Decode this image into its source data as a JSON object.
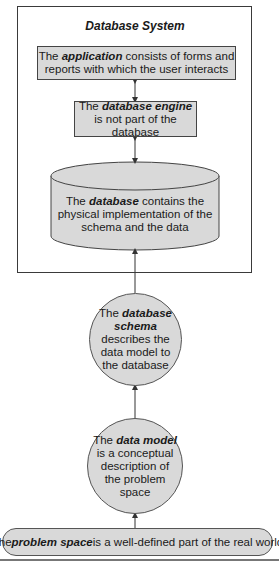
{
  "diagram": {
    "system_title": "Database System",
    "colors": {
      "node_fill": "#d9d9d9",
      "stroke": "#444444",
      "background": "#ffffff"
    },
    "nodes": {
      "application": {
        "prefix": "The ",
        "keyword": "application",
        "suffix": " consists of forms and reports with which the user interacts",
        "shape": "rectangle"
      },
      "engine": {
        "prefix": "The ",
        "keyword": "database engine",
        "suffix": " is not part of the database",
        "shape": "rectangle"
      },
      "database": {
        "prefix": "The ",
        "keyword": "database",
        "suffix": " contains the physical implementation of the schema and the data",
        "shape": "cylinder"
      },
      "schema": {
        "prefix": "The ",
        "keyword": "database schema",
        "suffix": " describes the data model to the database",
        "shape": "circle"
      },
      "data_model": {
        "prefix": "The ",
        "keyword": "data model",
        "suffix": " is a conceptual description of the problem space",
        "shape": "circle"
      },
      "problem_space": {
        "prefix": "The ",
        "keyword": "problem space",
        "suffix": " is a well-defined part of the real world",
        "shape": "rounded-rectangle"
      }
    },
    "edges": [
      {
        "from": "application",
        "to": "engine",
        "direction": "bidirectional"
      },
      {
        "from": "engine",
        "to": "database",
        "direction": "bidirectional"
      },
      {
        "from": "schema",
        "to": "database",
        "direction": "up"
      },
      {
        "from": "data_model",
        "to": "schema",
        "direction": "up"
      },
      {
        "from": "problem_space",
        "to": "data_model",
        "direction": "up"
      }
    ]
  }
}
